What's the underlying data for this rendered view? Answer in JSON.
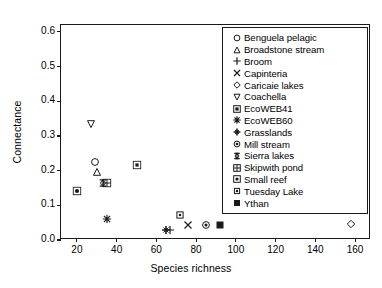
{
  "chart_data": {
    "type": "scatter",
    "title": "",
    "xlabel": "Species richness",
    "ylabel": "Connectance",
    "xlim": [
      12,
      168
    ],
    "ylim": [
      0.0,
      0.62
    ],
    "xticks": [
      20,
      40,
      60,
      80,
      100,
      120,
      140,
      160
    ],
    "yticks": [
      "0.0",
      "0.1",
      "0.2",
      "0.3",
      "0.4",
      "0.5",
      "0.6"
    ],
    "grid": false,
    "legend_position": "upper right",
    "series": [
      {
        "name": "Benguela pelagic",
        "marker": "circle-open",
        "x": [
          29
        ],
        "y": [
          0.225
        ]
      },
      {
        "name": "Broadstone stream",
        "marker": "triangle-up-open",
        "x": [
          30
        ],
        "y": [
          0.195
        ]
      },
      {
        "name": "Broom",
        "marker": "plus",
        "x": [
          67
        ],
        "y": [
          0.028
        ]
      },
      {
        "name": "Capinteria",
        "marker": "cross",
        "x": [
          76
        ],
        "y": [
          0.043
        ]
      },
      {
        "name": "Caricaie lakes",
        "marker": "diamond-open",
        "x": [
          158
        ],
        "y": [
          0.045
        ]
      },
      {
        "name": "Coachella",
        "marker": "triangle-down-open",
        "x": [
          27
        ],
        "y": [
          0.335
        ]
      },
      {
        "name": "EcoWEB41",
        "marker": "square-dot",
        "x": [
          50
        ],
        "y": [
          0.216
        ]
      },
      {
        "name": "EcoWEB60",
        "marker": "star-burst",
        "x": [
          35
        ],
        "y": [
          0.062
        ]
      },
      {
        "name": "Grasslands",
        "marker": "club",
        "x": [
          65
        ],
        "y": [
          0.028
        ]
      },
      {
        "name": "Mill stream",
        "marker": "circle-dot",
        "x": [
          85
        ],
        "y": [
          0.043
        ]
      },
      {
        "name": "Sierra lakes",
        "marker": "sierra",
        "x": [
          33
        ],
        "y": [
          0.163
        ]
      },
      {
        "name": "Skipwith pond",
        "marker": "square-grid",
        "x": [
          35
        ],
        "y": [
          0.163
        ]
      },
      {
        "name": "Small reef",
        "marker": "circle-in-square",
        "x": [
          20
        ],
        "y": [
          0.142
        ]
      },
      {
        "name": "Tuesday Lake",
        "marker": "square-small-dot",
        "x": [
          72
        ],
        "y": [
          0.073
        ]
      },
      {
        "name": "Ythan",
        "marker": "square-filled",
        "x": [
          92
        ],
        "y": [
          0.043
        ]
      }
    ]
  },
  "axes": {
    "ylabel": "Connectance",
    "xlabel": "Species richness",
    "xtick_labels": [
      "20",
      "40",
      "60",
      "80",
      "100",
      "120",
      "140",
      "160"
    ],
    "ytick_labels": [
      "0.0",
      "0.1",
      "0.2",
      "0.3",
      "0.4",
      "0.5",
      "0.6"
    ]
  },
  "legend": {
    "entries": [
      {
        "label": "Benguela pelagic"
      },
      {
        "label": "Broadstone stream"
      },
      {
        "label": "Broom"
      },
      {
        "label": "Capinteria"
      },
      {
        "label": "Caricaie lakes"
      },
      {
        "label": "Coachella"
      },
      {
        "label": "EcoWEB41"
      },
      {
        "label": "EcoWEB60"
      },
      {
        "label": "Grasslands"
      },
      {
        "label": "Mill stream"
      },
      {
        "label": "Sierra lakes"
      },
      {
        "label": "Skipwith pond"
      },
      {
        "label": "Small reef"
      },
      {
        "label": "Tuesday Lake"
      },
      {
        "label": "Ythan"
      }
    ]
  },
  "colors": {
    "ink": "#1a1a1a",
    "background": "#ffffff"
  }
}
